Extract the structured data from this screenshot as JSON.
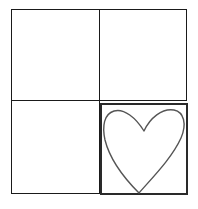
{
  "diagram": {
    "layout": "2x2 grid",
    "cells": [
      {
        "position": "top-left",
        "content": ""
      },
      {
        "position": "top-right",
        "content": ""
      },
      {
        "position": "bottom-left",
        "content": ""
      },
      {
        "position": "bottom-right",
        "content": "heart",
        "highlighted": true
      }
    ],
    "colors": {
      "line": "#1a1a1a",
      "heart_stroke": "#555555",
      "background": "#ffffff"
    }
  }
}
